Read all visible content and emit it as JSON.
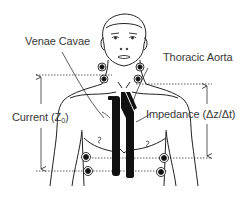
{
  "diagram": {
    "labels": {
      "venae_cavae": "Venae Cavae",
      "thoracic_aorta": "Thoracic Aorta",
      "current_prefix": "Current (Z",
      "current_subscript": "0",
      "current_suffix": ")",
      "impedance": "Impedance (Δz/Δt)"
    },
    "elements": {
      "electrodes": [
        {
          "id": "neck-left-upper",
          "x": 102,
          "y": 67
        },
        {
          "id": "neck-left-lower",
          "x": 104,
          "y": 79
        },
        {
          "id": "neck-right-upper",
          "x": 140,
          "y": 67
        },
        {
          "id": "neck-right-lower",
          "x": 138,
          "y": 79
        },
        {
          "id": "chest-left-upper",
          "x": 86,
          "y": 157
        },
        {
          "id": "chest-left-lower",
          "x": 88,
          "y": 171
        },
        {
          "id": "chest-right-upper",
          "x": 164,
          "y": 158
        },
        {
          "id": "chest-right-lower",
          "x": 161,
          "y": 172
        }
      ],
      "dotted_lines": [
        {
          "id": "upper-left",
          "y": 75
        },
        {
          "id": "upper-right",
          "y": 84
        },
        {
          "id": "lower-right",
          "y": 158
        },
        {
          "id": "lower-left",
          "y": 171
        }
      ],
      "arrows": [
        {
          "id": "current-arrow",
          "x": 41,
          "from_y": 75,
          "to_y": 171
        },
        {
          "id": "impedance-arrow",
          "x": 207,
          "from_y": 84,
          "to_y": 158
        }
      ]
    },
    "colors": {
      "ink": "#1a1a1a",
      "label": "#3a3a3a",
      "background": "#ffffff"
    }
  }
}
